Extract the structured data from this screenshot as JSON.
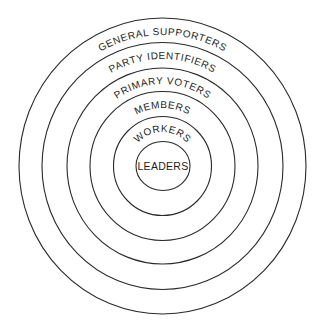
{
  "diagram": {
    "type": "concentric-circles",
    "center": {
      "x": 162.5,
      "y": 166
    },
    "stroke_color": "#2a2a2a",
    "background_color": "#ffffff",
    "rings": [
      {
        "label": "GENERAL SUPPORTERS",
        "rx": 143.5,
        "ry": 148
      },
      {
        "label": "PARTY IDENTIFIERS",
        "rx": 120.5,
        "ry": 123.5
      },
      {
        "label": "PRIMARY VOTERS",
        "rx": 95.5,
        "ry": 98
      },
      {
        "label": "MEMBERS",
        "rx": 72.5,
        "ry": 74.5
      },
      {
        "label": "WORKERS",
        "rx": 49,
        "ry": 49.5
      },
      {
        "label": "LEADERS",
        "rx": 27,
        "ry": 24.5
      }
    ]
  }
}
